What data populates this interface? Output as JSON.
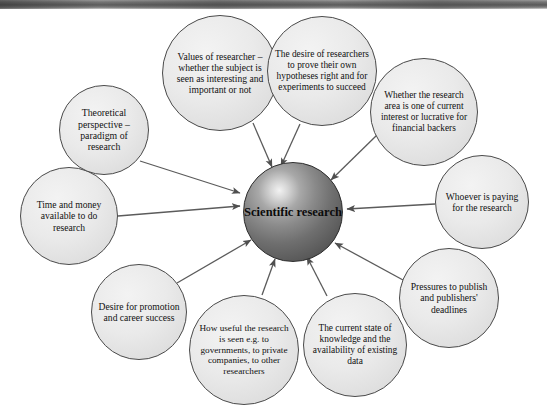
{
  "figure": {
    "type": "radial-concept-map",
    "center": {
      "id": "scientific-research",
      "text": "Scientific research",
      "shape": "sphere",
      "fill": "#6f6f6f",
      "text_color": "#0b0b0b",
      "cx": 293,
      "cy": 212,
      "r": 50,
      "font_size": 12.5
    },
    "edge_style": {
      "color": "#5b5b5b",
      "width": 1.3,
      "arrow": "solid-triangle",
      "direction": "into-center"
    },
    "node_style": {
      "fill": "#e9e9e9",
      "border": "#4a4a4a"
    },
    "nodes": [
      {
        "id": "values-of-researcher",
        "text": "Values of researcher – whether the subject is seen as interesting and important or not",
        "cx": 220,
        "cy": 73,
        "r": 58,
        "font_size": 9.6,
        "edge_from": [
          253,
          123
        ],
        "edge_to": [
          272,
          167
        ]
      },
      {
        "id": "desire-of-researchers",
        "text": "The desire of researchers to prove their own hypotheses right and for experiments to succeed",
        "cx": 322,
        "cy": 71,
        "r": 55,
        "font_size": 9.4,
        "edge_from": [
          300,
          124
        ],
        "edge_to": [
          281,
          166
        ]
      },
      {
        "id": "whether-research-area-current",
        "text": "Whether the research area is one of current interest or lucrative for financial backers",
        "cx": 424,
        "cy": 112,
        "r": 54,
        "font_size": 9.4,
        "edge_from": [
          377,
          135
        ],
        "edge_to": [
          331,
          180
        ]
      },
      {
        "id": "whoever-is-paying",
        "text": "Whoever is paying for the research",
        "cx": 482,
        "cy": 202,
        "r": 47,
        "font_size": 9.6,
        "edge_from": [
          435,
          204
        ],
        "edge_to": [
          347,
          209
        ]
      },
      {
        "id": "pressures-to-publish",
        "text": "Pressures to publish and publishers' deadlines",
        "cx": 449,
        "cy": 298,
        "r": 50,
        "font_size": 9.6,
        "edge_from": [
          403,
          280
        ],
        "edge_to": [
          335,
          243
        ]
      },
      {
        "id": "current-state-of-knowledge",
        "text": "The current state of knowledge and the availability of existing data",
        "cx": 355,
        "cy": 345,
        "r": 52,
        "font_size": 9.4,
        "edge_from": [
          327,
          296
        ],
        "edge_to": [
          307,
          257
        ]
      },
      {
        "id": "how-useful-the-research",
        "text": "How useful the research is seen e.g. to governments, to private companies, to other researchers",
        "cx": 244,
        "cy": 350,
        "r": 55,
        "font_size": 9.2,
        "edge_from": [
          262,
          295
        ],
        "edge_to": [
          275,
          259
        ]
      },
      {
        "id": "desire-for-promotion",
        "text": "Desire for promotion and career success",
        "cx": 139,
        "cy": 312,
        "r": 48,
        "font_size": 9.6,
        "edge_from": [
          177,
          283
        ],
        "edge_to": [
          251,
          240
        ]
      },
      {
        "id": "time-and-money",
        "text": "Time and money available to do research",
        "cx": 69,
        "cy": 216,
        "r": 49,
        "font_size": 9.6,
        "edge_from": [
          118,
          216
        ],
        "edge_to": [
          240,
          206
        ]
      },
      {
        "id": "theoretical-perspective",
        "text": "Theoretical perspective – paradigm of research",
        "cx": 104,
        "cy": 130,
        "r": 45,
        "font_size": 9.8,
        "edge_from": [
          140,
          161
        ],
        "edge_to": [
          240,
          193
        ]
      }
    ]
  }
}
